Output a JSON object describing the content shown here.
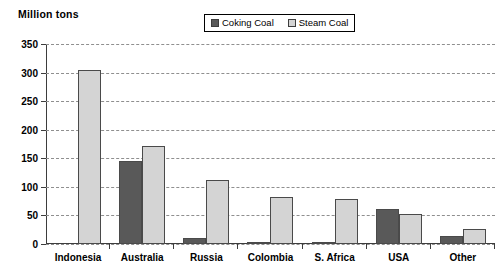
{
  "chart_data": {
    "type": "bar",
    "title": "",
    "ylabel": "Million tons",
    "xlabel": "",
    "ylim": [
      0,
      350
    ],
    "ytick_step": 50,
    "yticks": [
      "0",
      "50",
      "100",
      "150",
      "200",
      "250",
      "300",
      "350"
    ],
    "grid": true,
    "legend_position": "top-center",
    "categories": [
      "Indonesia",
      "Australia",
      "Russia",
      "Colombia",
      "S. Africa",
      "USA",
      "Other"
    ],
    "series": [
      {
        "name": "Coking Coal",
        "color": "#595959",
        "values": [
          0,
          145,
          10,
          2,
          2,
          62,
          14
        ]
      },
      {
        "name": "Steam Coal",
        "color": "#d4d4d4",
        "values": [
          305,
          172,
          112,
          83,
          78,
          53,
          27
        ]
      }
    ]
  },
  "legend": {
    "items": [
      {
        "label": "Coking Coal",
        "swatch": "coking-coal-swatch"
      },
      {
        "label": "Steam Coal",
        "swatch": "steam-coal-swatch"
      }
    ]
  }
}
